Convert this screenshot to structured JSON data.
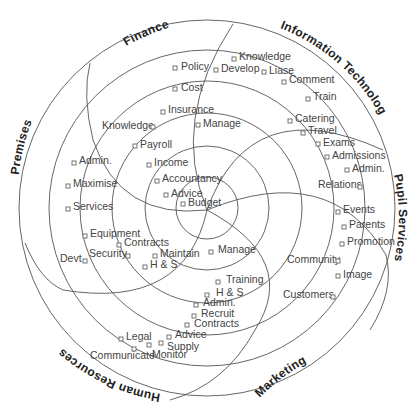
{
  "diagram": {
    "title": "",
    "sectors": [
      {
        "name": "Finance"
      },
      {
        "name": "Information Technology"
      },
      {
        "name": "Pupil Services"
      },
      {
        "name": "Marketing"
      },
      {
        "name": "Human Resources"
      },
      {
        "name": "Premises"
      }
    ],
    "items": [
      {
        "label": "Policy",
        "sector": "Finance"
      },
      {
        "label": "Cost",
        "sector": "Finance"
      },
      {
        "label": "Insurance",
        "sector": "Finance"
      },
      {
        "label": "Knowledge",
        "sector": "Finance"
      },
      {
        "label": "Payroll",
        "sector": "Finance"
      },
      {
        "label": "Income",
        "sector": "Finance"
      },
      {
        "label": "Accountancy",
        "sector": "Finance"
      },
      {
        "label": "Advice",
        "sector": "Finance"
      },
      {
        "label": "Budget",
        "sector": "Finance"
      },
      {
        "label": "Knowledge",
        "sector": "Information Technology"
      },
      {
        "label": "Develop",
        "sector": "Information Technology"
      },
      {
        "label": "Liase",
        "sector": "Information Technology"
      },
      {
        "label": "Comment",
        "sector": "Information Technology"
      },
      {
        "label": "Train",
        "sector": "Information Technology"
      },
      {
        "label": "Manage",
        "sector": "Information Technology"
      },
      {
        "label": "Catering",
        "sector": "Pupil Services"
      },
      {
        "label": "Travel",
        "sector": "Pupil Services"
      },
      {
        "label": "Exams",
        "sector": "Pupil Services"
      },
      {
        "label": "Admissions",
        "sector": "Pupil Services"
      },
      {
        "label": "Admin.",
        "sector": "Pupil Services"
      },
      {
        "label": "Relations",
        "sector": "Pupil Services"
      },
      {
        "label": "Events",
        "sector": "Pupil Services"
      },
      {
        "label": "Parents",
        "sector": "Pupil Services"
      },
      {
        "label": "Promotion",
        "sector": "Pupil Services"
      },
      {
        "label": "Community",
        "sector": "Marketing"
      },
      {
        "label": "Image",
        "sector": "Marketing"
      },
      {
        "label": "Customers",
        "sector": "Marketing"
      },
      {
        "label": "Manage",
        "sector": "Human Resources"
      },
      {
        "label": "Training",
        "sector": "Human Resources"
      },
      {
        "label": "H & S",
        "sector": "Human Resources"
      },
      {
        "label": "Admin.",
        "sector": "Human Resources"
      },
      {
        "label": "Recruit",
        "sector": "Human Resources"
      },
      {
        "label": "Contracts",
        "sector": "Human Resources"
      },
      {
        "label": "Advice",
        "sector": "Human Resources"
      },
      {
        "label": "Supply",
        "sector": "Human Resources"
      },
      {
        "label": "Monitor",
        "sector": "Human Resources"
      },
      {
        "label": "Legal",
        "sector": "Human Resources"
      },
      {
        "label": "Communicate",
        "sector": "Human Resources"
      },
      {
        "label": "Admin.",
        "sector": "Premises"
      },
      {
        "label": "Maximise",
        "sector": "Premises"
      },
      {
        "label": "Services",
        "sector": "Premises"
      },
      {
        "label": "Equipment",
        "sector": "Premises"
      },
      {
        "label": "Contracts",
        "sector": "Premises"
      },
      {
        "label": "Security",
        "sector": "Premises"
      },
      {
        "label": "Devt",
        "sector": "Premises"
      },
      {
        "label": "Maintain",
        "sector": "Premises"
      },
      {
        "label": "H & S",
        "sector": "Premises"
      }
    ],
    "colors": {
      "line": "#555555",
      "text": "#444444",
      "heading": "#222222",
      "background": "#ffffff"
    }
  }
}
